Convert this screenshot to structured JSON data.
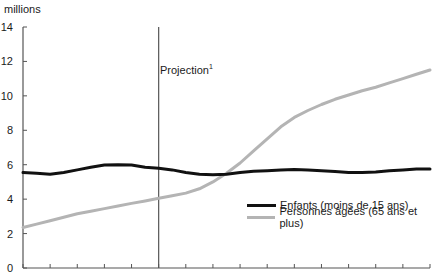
{
  "chart_data": {
    "type": "line",
    "title": "",
    "unit_label": "millions",
    "xlabel": "",
    "ylabel": "millions",
    "ylim": [
      0,
      14
    ],
    "yticks": [
      0,
      2,
      4,
      6,
      8,
      10,
      12,
      14
    ],
    "grid": false,
    "legend_position": "lower-right, inside plot",
    "annotation": {
      "text": "Projection",
      "superscript": "1",
      "type": "vertical-line",
      "x_index": 5
    },
    "x_tick_count": 16,
    "x_tick_labels": [],
    "x": [
      0,
      0.5,
      1,
      1.5,
      2,
      2.5,
      3,
      3.5,
      4,
      4.5,
      5,
      5.5,
      6,
      6.5,
      7,
      7.5,
      8,
      8.5,
      9,
      9.5,
      10,
      10.5,
      11,
      11.5,
      12,
      12.5,
      13,
      13.5,
      14,
      14.5,
      15
    ],
    "series": [
      {
        "name": "Enfants (moins de 15 ans)",
        "color": "#111111",
        "values": [
          5.55,
          5.5,
          5.45,
          5.55,
          5.7,
          5.85,
          5.98,
          6.0,
          5.98,
          5.85,
          5.8,
          5.7,
          5.55,
          5.45,
          5.42,
          5.45,
          5.55,
          5.62,
          5.65,
          5.7,
          5.72,
          5.7,
          5.65,
          5.6,
          5.55,
          5.55,
          5.58,
          5.65,
          5.7,
          5.75,
          5.75
        ]
      },
      {
        "name": "Personnes âgées (65 ans et plus)",
        "color": "#b4b4b4",
        "values": [
          2.35,
          2.55,
          2.75,
          2.95,
          3.15,
          3.3,
          3.45,
          3.6,
          3.75,
          3.9,
          4.05,
          4.2,
          4.35,
          4.6,
          5.0,
          5.5,
          6.1,
          6.8,
          7.5,
          8.2,
          8.75,
          9.15,
          9.5,
          9.8,
          10.05,
          10.3,
          10.5,
          10.75,
          11.0,
          11.25,
          11.5
        ]
      }
    ]
  },
  "labels": {
    "unit": "millions",
    "projection": "Projection",
    "projection_sup": "1",
    "legend_children": "Enfants (moins de 15 ans)",
    "legend_elderly": "Personnes âgées (65 ans et plus)"
  },
  "colors": {
    "axis": "#555555",
    "children_line": "#111111",
    "elderly_line": "#b4b4b4",
    "projection_line": "#555555"
  }
}
